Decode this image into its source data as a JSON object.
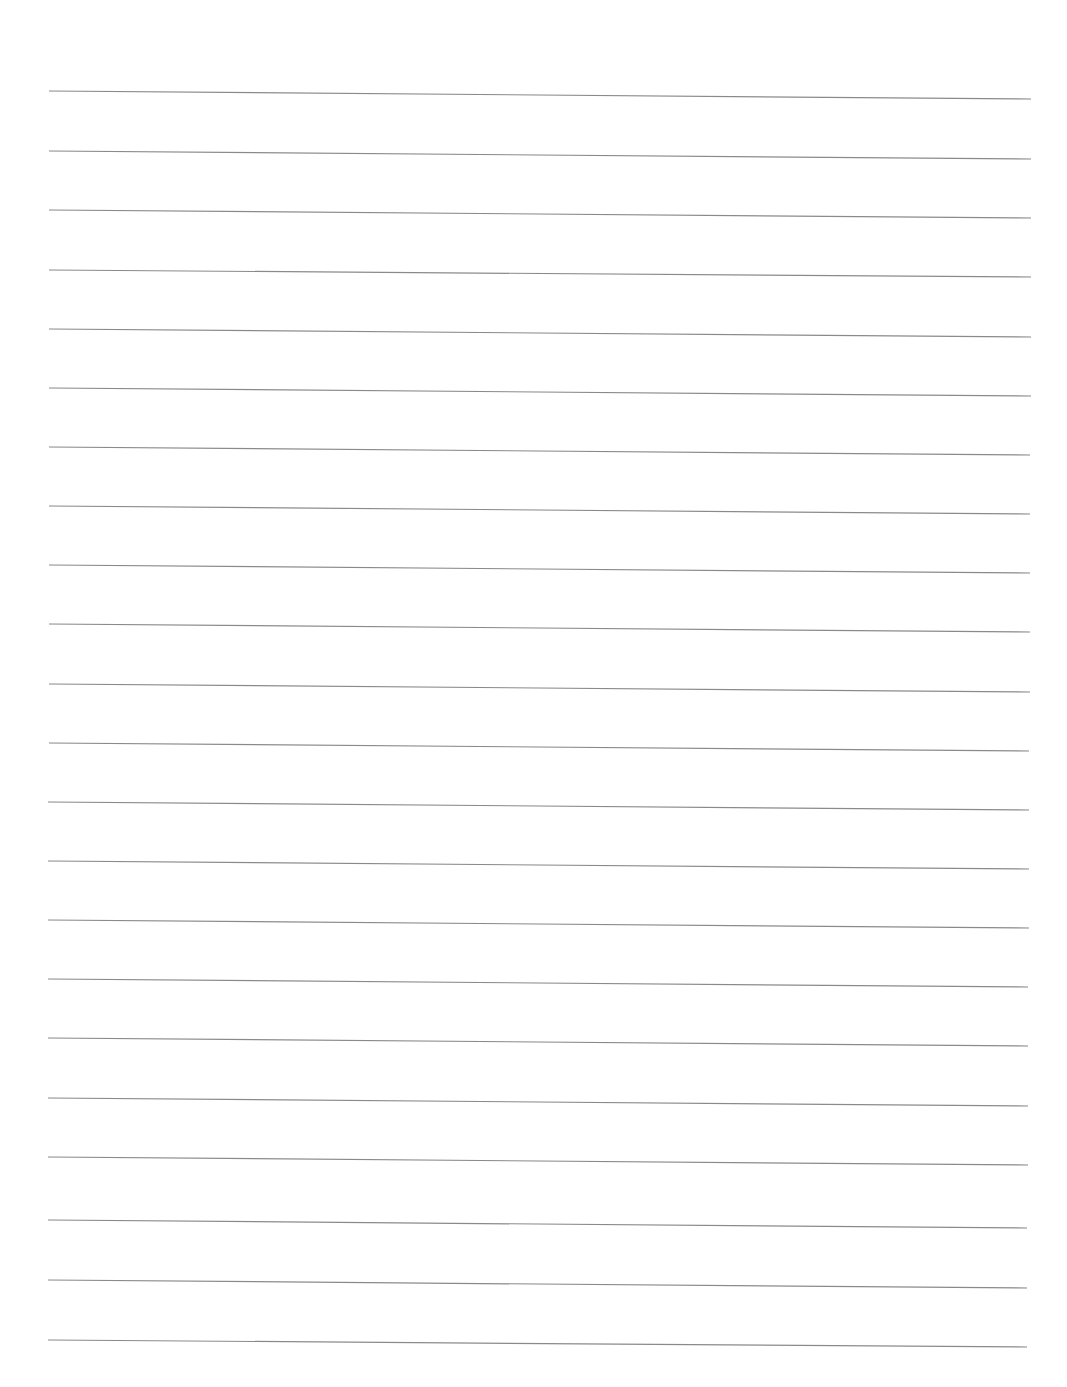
{
  "page": {
    "type": "lined-paper",
    "background": "#ffffff",
    "line_color": "#8a8a8a",
    "line_count": 22,
    "lines": [
      {
        "x1": 49,
        "y1": 91,
        "x2": 1031,
        "y2": 99
      },
      {
        "x1": 49,
        "y1": 151,
        "x2": 1031,
        "y2": 159
      },
      {
        "x1": 49,
        "y1": 210,
        "x2": 1031,
        "y2": 218
      },
      {
        "x1": 49,
        "y1": 270,
        "x2": 1031,
        "y2": 277
      },
      {
        "x1": 49,
        "y1": 329,
        "x2": 1031,
        "y2": 337
      },
      {
        "x1": 49,
        "y1": 388,
        "x2": 1031,
        "y2": 396
      },
      {
        "x1": 49,
        "y1": 447,
        "x2": 1030,
        "y2": 455
      },
      {
        "x1": 49,
        "y1": 506,
        "x2": 1030,
        "y2": 514
      },
      {
        "x1": 49,
        "y1": 565,
        "x2": 1030,
        "y2": 573
      },
      {
        "x1": 49,
        "y1": 624,
        "x2": 1030,
        "y2": 632
      },
      {
        "x1": 49,
        "y1": 684,
        "x2": 1030,
        "y2": 692
      },
      {
        "x1": 49,
        "y1": 743,
        "x2": 1029,
        "y2": 751
      },
      {
        "x1": 48,
        "y1": 802,
        "x2": 1029,
        "y2": 810
      },
      {
        "x1": 48,
        "y1": 861,
        "x2": 1029,
        "y2": 869
      },
      {
        "x1": 48,
        "y1": 920,
        "x2": 1029,
        "y2": 928
      },
      {
        "x1": 48,
        "y1": 979,
        "x2": 1028,
        "y2": 987
      },
      {
        "x1": 48,
        "y1": 1038,
        "x2": 1028,
        "y2": 1046
      },
      {
        "x1": 48,
        "y1": 1098,
        "x2": 1028,
        "y2": 1106
      },
      {
        "x1": 48,
        "y1": 1157,
        "x2": 1028,
        "y2": 1165
      },
      {
        "x1": 48,
        "y1": 1220,
        "x2": 1027,
        "y2": 1228
      },
      {
        "x1": 48,
        "y1": 1280,
        "x2": 1027,
        "y2": 1288
      },
      {
        "x1": 48,
        "y1": 1340,
        "x2": 1027,
        "y2": 1347
      }
    ]
  }
}
